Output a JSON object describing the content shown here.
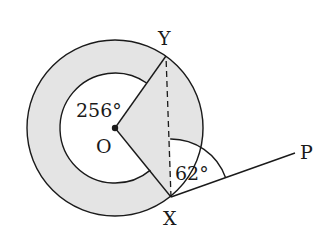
{
  "diagram": {
    "type": "geometry-circle-tangent",
    "colors": {
      "shade": "#e4e4e4",
      "line": "#1a1a1a",
      "background": "#ffffff"
    },
    "points": {
      "O": {
        "label": "O",
        "x": 115,
        "y": 128
      },
      "Y": {
        "label": "Y",
        "x": 166,
        "y": 56
      },
      "X": {
        "label": "X",
        "x": 171,
        "y": 197
      },
      "P": {
        "label": "P",
        "x": 295,
        "y": 153
      }
    },
    "circles": {
      "outer_radius": 88,
      "inner_radius": 55
    },
    "angles": {
      "reflex_YOX": {
        "label": "256°",
        "value": 256
      },
      "YXP": {
        "label": "62°",
        "value": 62
      }
    },
    "segments": [
      {
        "from": "O",
        "to": "Y",
        "style": "solid"
      },
      {
        "from": "O",
        "to": "X",
        "style": "solid"
      },
      {
        "from": "X",
        "to": "Y",
        "style": "dashed"
      },
      {
        "from": "X",
        "to": "P",
        "style": "solid"
      }
    ],
    "labels": {
      "Y": "Y",
      "X": "X",
      "O": "O",
      "P": "P",
      "angle_reflex": "256°",
      "angle_tangent": "62°"
    }
  }
}
